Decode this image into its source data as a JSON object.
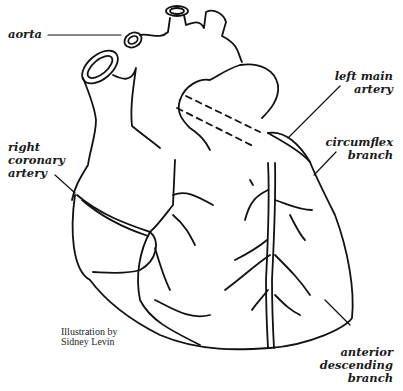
{
  "diagram": {
    "labels": {
      "aorta": "aorta",
      "left_main_artery": [
        "left main",
        "artery"
      ],
      "circumflex_branch": [
        "circumflex",
        "branch"
      ],
      "right_coronary_artery": [
        "right",
        "coronary",
        "artery"
      ],
      "anterior_descending_branch": [
        "anterior",
        "descending",
        "branch"
      ]
    },
    "credit": [
      "Illustration by",
      "Sidney Levin"
    ]
  },
  "colors": {
    "line": "#111111",
    "background": "#ffffff",
    "text": "#1a1a1a"
  }
}
